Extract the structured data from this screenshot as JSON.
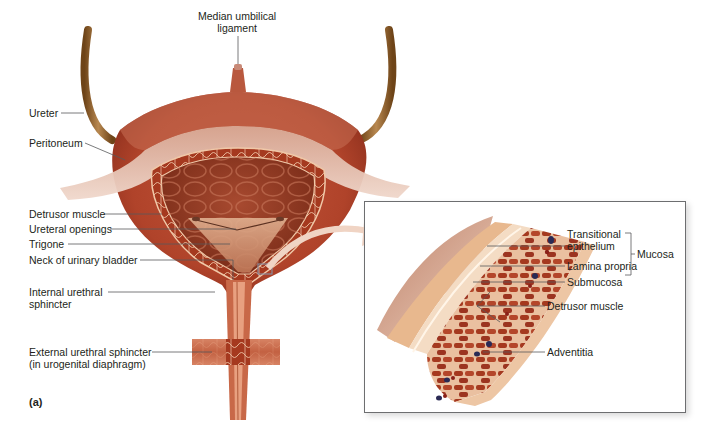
{
  "figure": {
    "panel_label": "(a)",
    "colors": {
      "muscle": "#b3442a",
      "muscle_dark": "#8a2e1c",
      "lumen": "#9a3a22",
      "peritoneum": "#e8c4b0",
      "ureter": "#8a5a2a",
      "trigone": "#d9a080",
      "inset_border": "#6d6e70",
      "label_text": "#231f20",
      "leader_line": "#58595b",
      "vessel_blue": "#2a2a55"
    }
  },
  "main_view": {
    "labels": [
      {
        "id": "median-umbilical-ligament",
        "text_line1": "Median umbilical",
        "text_line2": "ligament"
      },
      {
        "id": "ureter",
        "text": "Ureter"
      },
      {
        "id": "peritoneum",
        "text": "Peritoneum"
      },
      {
        "id": "detrusor-muscle",
        "text": "Detrusor muscle"
      },
      {
        "id": "ureteral-openings",
        "text": "Ureteral openings"
      },
      {
        "id": "trigone",
        "text": "Trigone"
      },
      {
        "id": "neck-of-urinary-bladder",
        "text": "Neck of urinary bladder"
      },
      {
        "id": "internal-urethral-sphincter",
        "text_line1": "Internal urethral",
        "text_line2": "sphincter"
      },
      {
        "id": "external-urethral-sphincter",
        "text_line1": "External urethral sphincter",
        "text_line2": "(in urogenital diaphragm)"
      }
    ]
  },
  "inset_view": {
    "labels": [
      {
        "id": "transitional-epithelium",
        "text_line1": "Transitional",
        "text_line2": "epithelium"
      },
      {
        "id": "lamina-propria",
        "text": "Lamina propria"
      },
      {
        "id": "submucosa",
        "text": "Submucosa"
      },
      {
        "id": "detrusor-muscle-inset",
        "text": "Detrusor muscle"
      },
      {
        "id": "adventitia",
        "text": "Adventitia"
      }
    ],
    "bracket_label": "Mucosa"
  }
}
